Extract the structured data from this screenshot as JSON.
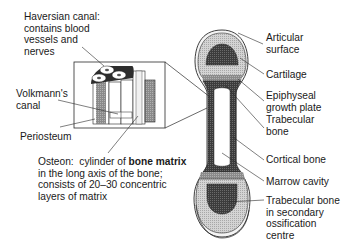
{
  "diagram": {
    "type": "anatomical-diagram",
    "labels_left": {
      "haversian_canal": [
        "Haversian canal:",
        "contains blood",
        "vessels and",
        "nerves"
      ],
      "volkmanns_canal": [
        "Volkmann's",
        "canal"
      ],
      "periosteum": "Periosteum",
      "osteon": {
        "line1_prefix": "Osteon:  cylinder of ",
        "line1_bold": "bone matrix",
        "line2": "in the long axis of the bone;",
        "line3": "consists of 20–30 concentric",
        "line4": "layers of matrix"
      }
    },
    "labels_right": {
      "articular_surface": [
        "Articular",
        "surface"
      ],
      "cartilage": "Cartilage",
      "epiphyseal_growth_plate": [
        "Epiphyseal",
        "growth plate"
      ],
      "trabecular_bone": [
        "Trabecular",
        "bone"
      ],
      "cortical_bone": "Cortical bone",
      "marrow_cavity": "Marrow cavity",
      "trabecular_secondary": [
        "Trabecular bone",
        "in secondary",
        "ossification",
        "centre"
      ]
    },
    "colors": {
      "line": "#2a2a2a",
      "cartilage": "#c9c9c9",
      "dark_bone": "#4a4a4a",
      "growth_plate": "#9a9a9a",
      "marrow": "#ffffff"
    }
  }
}
